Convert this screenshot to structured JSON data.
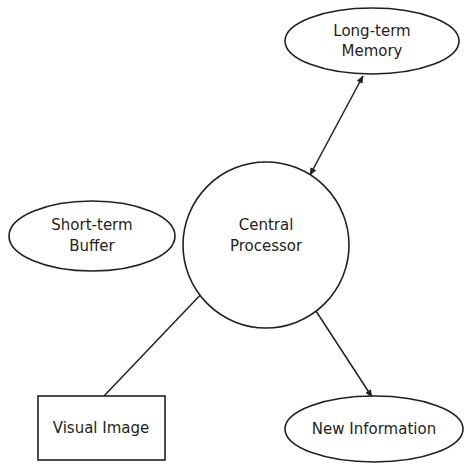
{
  "diagram": {
    "nodes": {
      "long_term_memory": {
        "line1": "Long-term",
        "line2": "Memory",
        "shape": "ellipse"
      },
      "short_term_buffer": {
        "line1": "Short-term",
        "line2": "Buffer",
        "shape": "ellipse"
      },
      "central_processor": {
        "line1": "Central",
        "line2": "Processor",
        "shape": "circle"
      },
      "visual_image": {
        "label": "Visual Image",
        "shape": "rectangle"
      },
      "new_information": {
        "label": "New Information",
        "shape": "ellipse"
      }
    },
    "edges": [
      {
        "from": "central_processor",
        "to": "long_term_memory",
        "direction": "bidirectional"
      },
      {
        "from": "visual_image",
        "to": "central_processor",
        "direction": "forward"
      },
      {
        "from": "central_processor",
        "to": "new_information",
        "direction": "forward"
      }
    ],
    "colors": {
      "stroke": "#231f20",
      "background": "#ffffff"
    }
  }
}
